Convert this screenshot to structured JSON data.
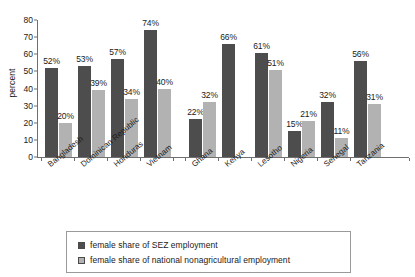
{
  "chart_data": {
    "type": "bar",
    "title": "",
    "xlabel": "",
    "ylabel": "percent",
    "ylim": [
      0,
      80
    ],
    "yticks": [
      "0",
      "10",
      "20",
      "30",
      "40",
      "50",
      "60",
      "70",
      "80"
    ],
    "grid": false,
    "legend_position": "bottom",
    "categories": [
      "Bangladesh",
      "Dominican Republic",
      "Honduras",
      "Vietnam",
      "Ghana",
      "Kenya",
      "Lesotho",
      "Nigeria",
      "Senegal",
      "Tanzania"
    ],
    "groups": [
      {
        "name": "group-1",
        "categories": [
          "Bangladesh",
          "Dominican Republic",
          "Honduras",
          "Vietnam"
        ]
      },
      {
        "name": "group-2",
        "categories": [
          "Ghana",
          "Kenya",
          "Lesotho",
          "Nigeria",
          "Senegal",
          "Tanzania"
        ]
      }
    ],
    "series": [
      {
        "name": "female share of SEZ employment",
        "color": "#4d4d4d",
        "values": [
          52,
          53,
          57,
          74,
          22,
          66,
          61,
          15,
          32,
          56
        ],
        "labels": [
          "52%",
          "53%",
          "57%",
          "74%",
          "22%",
          "66%",
          "61%",
          "15%",
          "32%",
          "56%"
        ]
      },
      {
        "name": "female share of national nonagricultural employment",
        "color": "#b2b2b2",
        "values": [
          20,
          39,
          34,
          40,
          32,
          null,
          51,
          21,
          11,
          31
        ],
        "labels": [
          "20%",
          "39%",
          "34%",
          "40%",
          "32%",
          null,
          "51%",
          "21%",
          "11%",
          "31%"
        ]
      }
    ]
  },
  "legend": {
    "items": [
      {
        "label": "female share of SEZ employment",
        "swatch": "dark"
      },
      {
        "label": "female share of national nonagricultural employment",
        "swatch": "light"
      }
    ]
  },
  "colors": {
    "series_dark": "#4d4d4d",
    "series_light": "#b2b2b2",
    "axis": "#6f6f6f",
    "text": "#1a1a1a",
    "background": "#ffffff"
  }
}
